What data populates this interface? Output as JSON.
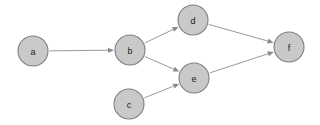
{
  "diagram": {
    "type": "directed-graph",
    "title": "",
    "background_color": "#ffffff",
    "node_fill_color": "#c9c9c9",
    "node_stroke_color": "#7f7f7f",
    "node_label_color": "#1a1a1a",
    "edge_color": "#9a9a9a",
    "arrowhead_color": "#8a8a8a",
    "node_radius": 15,
    "nodes": [
      {
        "id": "a",
        "label": "a",
        "cx": 33,
        "cy": 51
      },
      {
        "id": "b",
        "label": "b",
        "cx": 130,
        "cy": 50
      },
      {
        "id": "c",
        "label": "c",
        "cx": 129,
        "cy": 104
      },
      {
        "id": "d",
        "label": "d",
        "cx": 193,
        "cy": 20
      },
      {
        "id": "e",
        "label": "e",
        "cx": 194,
        "cy": 78
      },
      {
        "id": "f",
        "label": "f",
        "cx": 289,
        "cy": 47
      }
    ],
    "edges": [
      {
        "id": "a-b",
        "from": "a",
        "to": "b",
        "directed": true
      },
      {
        "id": "b-d",
        "from": "b",
        "to": "d",
        "directed": true
      },
      {
        "id": "b-e",
        "from": "b",
        "to": "e",
        "directed": true
      },
      {
        "id": "c-e",
        "from": "c",
        "to": "e",
        "directed": true
      },
      {
        "id": "d-f",
        "from": "d",
        "to": "f",
        "directed": true
      },
      {
        "id": "e-f",
        "from": "e",
        "to": "f",
        "directed": true
      }
    ]
  }
}
